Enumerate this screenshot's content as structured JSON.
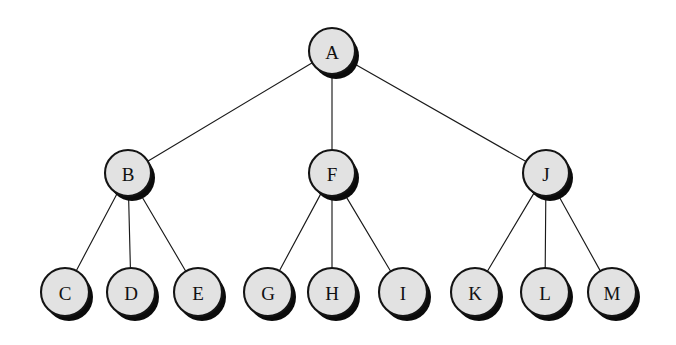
{
  "diagram": {
    "type": "tree",
    "background_color": "#ffffff",
    "node_fill_color": "#e2e2e2",
    "node_stroke_color": "#141414",
    "node_shadow_color": "#0b0b0b",
    "edge_color": "#1a1a1a",
    "label_color": "#111111",
    "node_radius": 23,
    "leaf_radius": 24,
    "shadow_offset_x": 4,
    "shadow_offset_y": 5,
    "nodes": [
      {
        "id": "A",
        "label": "A",
        "cx": 332,
        "cy": 51,
        "r": 23,
        "level": 0,
        "parent": null
      },
      {
        "id": "B",
        "label": "B",
        "cx": 128,
        "cy": 173,
        "r": 23,
        "level": 1,
        "parent": "A"
      },
      {
        "id": "F",
        "label": "F",
        "cx": 332,
        "cy": 173,
        "r": 23,
        "level": 1,
        "parent": "A"
      },
      {
        "id": "J",
        "label": "J",
        "cx": 546,
        "cy": 173,
        "r": 23,
        "level": 1,
        "parent": "A"
      },
      {
        "id": "C",
        "label": "C",
        "cx": 65,
        "cy": 292,
        "r": 24,
        "level": 2,
        "parent": "B"
      },
      {
        "id": "D",
        "label": "D",
        "cx": 131,
        "cy": 292,
        "r": 24,
        "level": 2,
        "parent": "B"
      },
      {
        "id": "E",
        "label": "E",
        "cx": 198,
        "cy": 292,
        "r": 24,
        "level": 2,
        "parent": "B"
      },
      {
        "id": "G",
        "label": "G",
        "cx": 268,
        "cy": 292,
        "r": 24,
        "level": 2,
        "parent": "F"
      },
      {
        "id": "H",
        "label": "H",
        "cx": 332,
        "cy": 292,
        "r": 24,
        "level": 2,
        "parent": "F"
      },
      {
        "id": "I",
        "label": "I",
        "cx": 403,
        "cy": 292,
        "r": 24,
        "level": 2,
        "parent": "F"
      },
      {
        "id": "K",
        "label": "K",
        "cx": 475,
        "cy": 292,
        "r": 24,
        "level": 2,
        "parent": "J"
      },
      {
        "id": "L",
        "label": "L",
        "cx": 545,
        "cy": 292,
        "r": 24,
        "level": 2,
        "parent": "J"
      },
      {
        "id": "M",
        "label": "M",
        "cx": 612,
        "cy": 292,
        "r": 24,
        "level": 2,
        "parent": "J"
      }
    ],
    "edges": [
      {
        "from": "A",
        "to": "B"
      },
      {
        "from": "A",
        "to": "F"
      },
      {
        "from": "A",
        "to": "J"
      },
      {
        "from": "B",
        "to": "C"
      },
      {
        "from": "B",
        "to": "D"
      },
      {
        "from": "B",
        "to": "E"
      },
      {
        "from": "F",
        "to": "G"
      },
      {
        "from": "F",
        "to": "H"
      },
      {
        "from": "F",
        "to": "I"
      },
      {
        "from": "J",
        "to": "K"
      },
      {
        "from": "J",
        "to": "L"
      },
      {
        "from": "J",
        "to": "M"
      }
    ]
  }
}
